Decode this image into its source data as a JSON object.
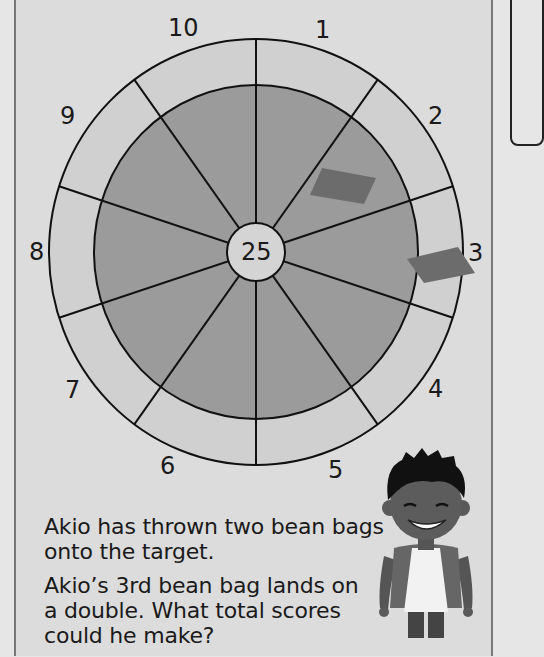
{
  "target": {
    "bullseye_label": "25",
    "sector_labels": [
      {
        "label": "10",
        "x": 168,
        "y": 16
      },
      {
        "label": "1",
        "x": 315,
        "y": 18
      },
      {
        "label": "2",
        "x": 428,
        "y": 104
      },
      {
        "label": "3",
        "x": 468,
        "y": 241
      },
      {
        "label": "4",
        "x": 428,
        "y": 377
      },
      {
        "label": "5",
        "x": 328,
        "y": 458
      },
      {
        "label": "6",
        "x": 160,
        "y": 454
      },
      {
        "label": "7",
        "x": 65,
        "y": 378
      },
      {
        "label": "8",
        "x": 29,
        "y": 240
      },
      {
        "label": "9",
        "x": 60,
        "y": 104
      }
    ],
    "colors": {
      "background": "#dcdcdc",
      "double_ring": "#d0d0d0",
      "single_area": "#9b9b9b",
      "bullseye": "#d4d4d4",
      "bean_bag": "#6c6c6c",
      "line": "#111111"
    }
  },
  "question": {
    "para1": [
      "Akio has thrown two bean bags",
      "onto the target."
    ],
    "para2": [
      "Akio’s 3rd bean bag lands on",
      "a double. What total scores",
      "could he make?"
    ]
  },
  "character": {
    "name": "Akio"
  }
}
